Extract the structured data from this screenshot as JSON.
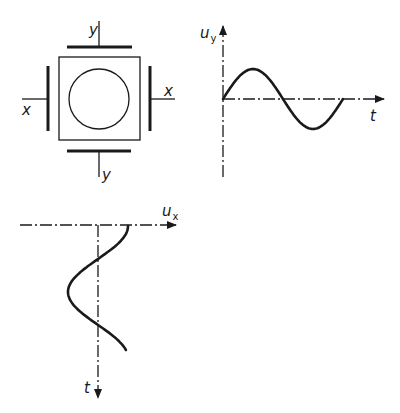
{
  "diagram": {
    "title": "",
    "deflection_system": {
      "description": "CRT screen with two pairs of deflection plates",
      "screen_shape": "square-with-circle",
      "plates": [
        {
          "id": "top",
          "label": "y"
        },
        {
          "id": "bottom",
          "label": "y"
        },
        {
          "id": "left",
          "label": "x"
        },
        {
          "id": "right",
          "label": "x"
        }
      ]
    },
    "graph_uy": {
      "y_axis_label": "u",
      "y_axis_subscript": "y",
      "x_axis_label": "t",
      "waveform": "sine",
      "cycles": 1,
      "orientation": "horizontal-time"
    },
    "graph_ux": {
      "x_axis_label": "u",
      "x_axis_subscript": "x",
      "y_axis_label": "t",
      "waveform": "sine",
      "cycles": 1,
      "orientation": "vertical-time"
    }
  }
}
